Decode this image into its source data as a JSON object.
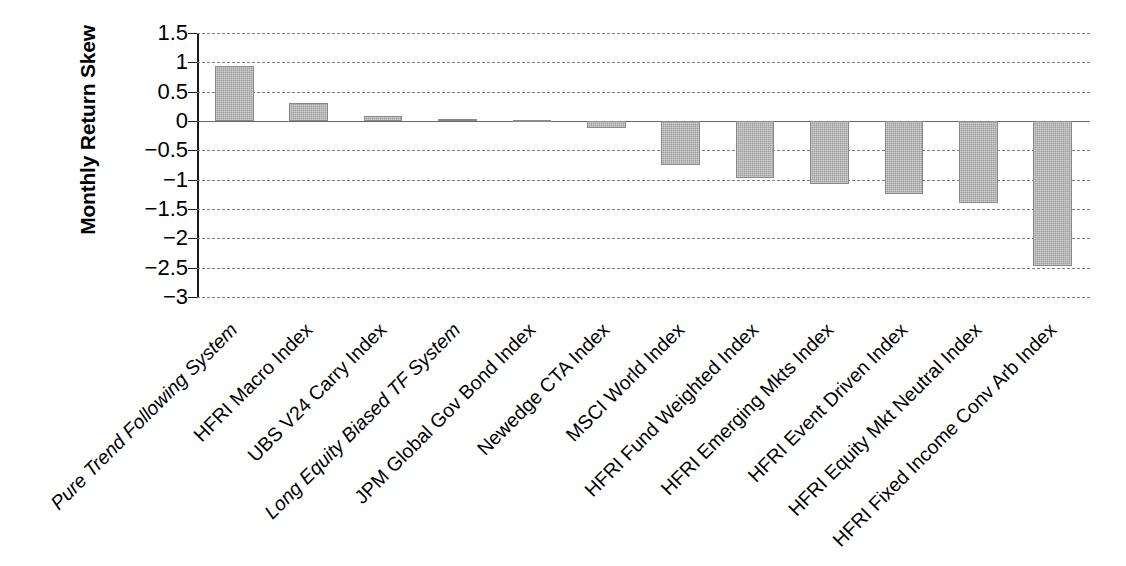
{
  "chart_data": {
    "type": "bar",
    "title": "",
    "subtitle": "",
    "xlabel": "",
    "ylabel": "Monthly Return Skew",
    "ylim": [
      -3,
      1.5
    ],
    "yticks": [
      1.5,
      1,
      0.5,
      0,
      -0.5,
      -1,
      -1.5,
      -2,
      -2.5,
      -3
    ],
    "ytick_labels": [
      "1.5",
      "1",
      "0.5",
      "0",
      "−0.5",
      "−1",
      "−1.5",
      "−2",
      "−2.5",
      "−3"
    ],
    "grid": "horizontal-dashed",
    "legend": "none",
    "bar_color": "#9c9c9c",
    "bar_edge_color": "#8a8a8a",
    "gridline_color": "#808080",
    "axis_color": "#1a1a1a",
    "categories": [
      "Pure Trend Following System",
      "HFRI Macro Index",
      "UBS V24 Carry Index",
      "Long Equity Biased TF System",
      "JPM Global Gov Bond Index",
      "Newedge CTA Index",
      "MSCI World Index",
      "HFRI Fund Weighted Index",
      "HFRI Emerging Mkts Index",
      "HFRI Event Driven Index",
      "HFRI Equity Mkt Neutral Index",
      "HFRI Fixed Income Conv Arb Index"
    ],
    "category_styles": [
      "italic",
      "normal",
      "normal",
      "italic",
      "normal",
      "normal",
      "normal",
      "normal",
      "normal",
      "normal",
      "normal",
      "normal"
    ],
    "values": [
      0.93,
      0.31,
      0.09,
      0.04,
      0.02,
      -0.12,
      -0.75,
      -0.98,
      -1.08,
      -1.25,
      -1.4,
      -2.47
    ]
  }
}
